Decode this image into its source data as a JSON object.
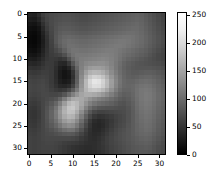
{
  "figure": {
    "background_color": "#ffffff",
    "width": 212,
    "height": 181
  },
  "chart_data": {
    "type": "heatmap",
    "title": "",
    "xlabel": "",
    "ylabel": "",
    "colormap": "gray",
    "vmin": 0,
    "vmax": 255,
    "xlim": [
      -0.5,
      31.5
    ],
    "ylim": [
      31.5,
      -0.5
    ],
    "grid": false,
    "x_ticks": [
      0,
      5,
      10,
      15,
      20,
      25,
      30
    ],
    "x_tick_labels": [
      "0",
      "5",
      "10",
      "15",
      "20",
      "25",
      "30"
    ],
    "y_ticks": [
      0,
      5,
      10,
      15,
      20,
      25,
      30
    ],
    "y_tick_labels": [
      "0",
      "5",
      "10",
      "15",
      "20",
      "25",
      "30"
    ],
    "shape": [
      32,
      32
    ],
    "values": [
      [
        36,
        34,
        46,
        62,
        70,
        74,
        76,
        78,
        80,
        80,
        78,
        76,
        74,
        74,
        76,
        78,
        80,
        82,
        84,
        86,
        88,
        90,
        92,
        94,
        96,
        98,
        96,
        90,
        84,
        78,
        72,
        66
      ],
      [
        30,
        28,
        38,
        56,
        68,
        74,
        78,
        80,
        82,
        82,
        80,
        78,
        76,
        76,
        78,
        80,
        82,
        84,
        86,
        88,
        90,
        92,
        94,
        96,
        98,
        100,
        98,
        92,
        86,
        80,
        74,
        68
      ],
      [
        22,
        20,
        28,
        48,
        64,
        74,
        80,
        84,
        86,
        86,
        84,
        82,
        80,
        80,
        82,
        84,
        86,
        88,
        90,
        92,
        94,
        96,
        98,
        100,
        102,
        104,
        100,
        94,
        88,
        82,
        76,
        70
      ],
      [
        16,
        14,
        20,
        40,
        60,
        72,
        82,
        88,
        90,
        90,
        88,
        86,
        84,
        84,
        86,
        88,
        90,
        92,
        94,
        96,
        98,
        100,
        102,
        104,
        106,
        106,
        102,
        96,
        90,
        84,
        78,
        72
      ],
      [
        12,
        10,
        16,
        34,
        54,
        70,
        84,
        92,
        96,
        96,
        94,
        92,
        90,
        90,
        92,
        94,
        96,
        98,
        100,
        102,
        104,
        106,
        108,
        110,
        110,
        108,
        104,
        98,
        92,
        86,
        80,
        74
      ],
      [
        10,
        8,
        14,
        30,
        50,
        68,
        86,
        96,
        102,
        104,
        102,
        100,
        98,
        98,
        100,
        102,
        104,
        106,
        108,
        110,
        112,
        114,
        116,
        116,
        114,
        110,
        106,
        100,
        94,
        88,
        82,
        76
      ],
      [
        10,
        8,
        14,
        28,
        48,
        66,
        86,
        98,
        106,
        110,
        108,
        106,
        104,
        104,
        106,
        108,
        110,
        112,
        114,
        116,
        118,
        120,
        120,
        118,
        114,
        110,
        106,
        100,
        94,
        88,
        82,
        76
      ],
      [
        12,
        10,
        16,
        30,
        48,
        64,
        80,
        94,
        104,
        112,
        112,
        110,
        108,
        108,
        110,
        112,
        114,
        116,
        118,
        120,
        122,
        122,
        120,
        116,
        112,
        108,
        104,
        98,
        92,
        86,
        80,
        74
      ],
      [
        16,
        14,
        20,
        34,
        50,
        62,
        72,
        82,
        96,
        110,
        116,
        116,
        114,
        114,
        116,
        118,
        120,
        122,
        124,
        124,
        122,
        118,
        114,
        110,
        106,
        102,
        98,
        94,
        88,
        82,
        76,
        70
      ],
      [
        22,
        20,
        26,
        38,
        52,
        60,
        64,
        68,
        80,
        100,
        114,
        120,
        120,
        120,
        122,
        124,
        126,
        128,
        128,
        126,
        122,
        116,
        110,
        106,
        102,
        98,
        94,
        90,
        84,
        78,
        72,
        68
      ],
      [
        30,
        28,
        34,
        44,
        54,
        58,
        56,
        52,
        58,
        80,
        104,
        118,
        124,
        126,
        128,
        130,
        132,
        134,
        132,
        128,
        122,
        114,
        106,
        100,
        96,
        92,
        88,
        84,
        80,
        76,
        72,
        68
      ],
      [
        40,
        38,
        42,
        50,
        58,
        58,
        50,
        40,
        38,
        56,
        86,
        112,
        126,
        134,
        138,
        140,
        142,
        142,
        138,
        130,
        120,
        110,
        100,
        94,
        90,
        86,
        84,
        82,
        80,
        78,
        76,
        72
      ],
      [
        50,
        48,
        50,
        56,
        60,
        58,
        46,
        32,
        26,
        36,
        66,
        102,
        128,
        144,
        154,
        158,
        158,
        154,
        146,
        134,
        120,
        108,
        98,
        92,
        88,
        86,
        86,
        86,
        86,
        84,
        82,
        78
      ],
      [
        58,
        56,
        58,
        62,
        62,
        58,
        44,
        28,
        20,
        26,
        52,
        94,
        132,
        158,
        176,
        182,
        180,
        172,
        158,
        140,
        124,
        110,
        100,
        94,
        90,
        90,
        92,
        94,
        94,
        92,
        88,
        84
      ],
      [
        64,
        62,
        64,
        66,
        64,
        58,
        44,
        28,
        20,
        24,
        48,
        92,
        138,
        172,
        198,
        210,
        206,
        194,
        174,
        150,
        130,
        114,
        102,
        96,
        94,
        96,
        100,
        102,
        102,
        98,
        94,
        88
      ],
      [
        68,
        66,
        68,
        70,
        66,
        58,
        46,
        32,
        26,
        30,
        54,
        96,
        144,
        184,
        214,
        230,
        226,
        210,
        186,
        158,
        134,
        116,
        104,
        100,
        100,
        104,
        108,
        110,
        108,
        104,
        98,
        92
      ],
      [
        70,
        68,
        70,
        72,
        68,
        60,
        50,
        40,
        38,
        44,
        66,
        104,
        148,
        184,
        210,
        222,
        220,
        206,
        184,
        156,
        132,
        114,
        104,
        102,
        104,
        110,
        114,
        116,
        114,
        108,
        102,
        96
      ],
      [
        70,
        68,
        70,
        72,
        70,
        64,
        58,
        54,
        58,
        70,
        92,
        122,
        154,
        180,
        196,
        200,
        196,
        184,
        166,
        144,
        124,
        108,
        100,
        100,
        104,
        112,
        118,
        120,
        118,
        112,
        104,
        98
      ],
      [
        68,
        66,
        68,
        72,
        72,
        70,
        70,
        74,
        86,
        106,
        128,
        148,
        164,
        172,
        172,
        168,
        162,
        152,
        140,
        126,
        112,
        100,
        94,
        96,
        102,
        112,
        118,
        122,
        120,
        114,
        106,
        100
      ],
      [
        64,
        62,
        66,
        70,
        74,
        78,
        84,
        100,
        124,
        150,
        168,
        172,
        168,
        158,
        146,
        136,
        128,
        122,
        116,
        108,
        100,
        92,
        88,
        92,
        100,
        110,
        118,
        122,
        120,
        114,
        106,
        100
      ],
      [
        60,
        58,
        62,
        70,
        78,
        88,
        102,
        126,
        156,
        182,
        192,
        184,
        166,
        146,
        128,
        116,
        108,
        104,
        100,
        96,
        90,
        84,
        82,
        88,
        96,
        108,
        116,
        120,
        118,
        112,
        104,
        98
      ],
      [
        56,
        54,
        60,
        70,
        82,
        96,
        116,
        144,
        174,
        196,
        200,
        184,
        158,
        130,
        108,
        94,
        86,
        84,
        82,
        82,
        80,
        78,
        78,
        84,
        94,
        106,
        114,
        118,
        116,
        110,
        102,
        96
      ],
      [
        54,
        52,
        58,
        70,
        84,
        100,
        122,
        150,
        178,
        194,
        192,
        172,
        142,
        112,
        88,
        72,
        66,
        66,
        68,
        70,
        72,
        74,
        76,
        82,
        92,
        104,
        112,
        116,
        114,
        108,
        100,
        94
      ],
      [
        54,
        52,
        58,
        70,
        84,
        100,
        120,
        146,
        170,
        182,
        178,
        156,
        126,
        96,
        72,
        56,
        50,
        52,
        56,
        60,
        66,
        70,
        74,
        82,
        92,
        102,
        110,
        114,
        112,
        106,
        98,
        92
      ],
      [
        56,
        54,
        60,
        70,
        82,
        96,
        112,
        134,
        154,
        164,
        158,
        138,
        110,
        82,
        58,
        44,
        40,
        44,
        50,
        56,
        64,
        70,
        74,
        82,
        92,
        102,
        108,
        112,
        110,
        104,
        96,
        90
      ],
      [
        58,
        56,
        62,
        70,
        80,
        90,
        102,
        118,
        134,
        142,
        138,
        120,
        96,
        72,
        52,
        40,
        38,
        42,
        50,
        58,
        66,
        72,
        76,
        84,
        92,
        100,
        106,
        110,
        108,
        102,
        94,
        88
      ],
      [
        62,
        60,
        64,
        70,
        76,
        82,
        90,
        100,
        110,
        116,
        114,
        100,
        82,
        62,
        48,
        40,
        40,
        46,
        54,
        62,
        70,
        76,
        80,
        86,
        92,
        100,
        104,
        108,
        106,
        100,
        92,
        86
      ],
      [
        64,
        62,
        66,
        70,
        74,
        76,
        80,
        84,
        88,
        90,
        88,
        80,
        68,
        56,
        46,
        42,
        44,
        50,
        58,
        66,
        72,
        78,
        82,
        86,
        92,
        98,
        102,
        104,
        102,
        96,
        90,
        84
      ],
      [
        66,
        64,
        66,
        70,
        72,
        72,
        72,
        72,
        72,
        72,
        70,
        66,
        58,
        52,
        46,
        44,
        48,
        54,
        62,
        68,
        74,
        78,
        82,
        86,
        90,
        94,
        98,
        100,
        98,
        92,
        86,
        80
      ],
      [
        66,
        64,
        66,
        68,
        70,
        70,
        68,
        66,
        62,
        60,
        58,
        56,
        52,
        48,
        46,
        46,
        50,
        56,
        62,
        68,
        72,
        76,
        80,
        84,
        88,
        92,
        94,
        96,
        94,
        88,
        82,
        76
      ],
      [
        66,
        64,
        66,
        68,
        68,
        68,
        66,
        62,
        58,
        54,
        50,
        48,
        46,
        44,
        44,
        46,
        50,
        54,
        60,
        66,
        70,
        74,
        78,
        82,
        86,
        88,
        90,
        92,
        90,
        84,
        78,
        74
      ],
      [
        64,
        62,
        64,
        66,
        66,
        66,
        64,
        60,
        56,
        52,
        48,
        46,
        44,
        42,
        42,
        44,
        48,
        52,
        58,
        64,
        68,
        72,
        76,
        80,
        84,
        86,
        88,
        88,
        86,
        82,
        76,
        72
      ]
    ]
  },
  "colorbar": {
    "orientation": "vertical",
    "ticks": [
      0,
      50,
      100,
      150,
      200,
      250
    ],
    "tick_labels": [
      "0",
      "50",
      "100",
      "150",
      "200",
      "250"
    ],
    "vmin": 0,
    "vmax": 255,
    "gradient_low_color": "#000000",
    "gradient_high_color": "#ffffff"
  }
}
